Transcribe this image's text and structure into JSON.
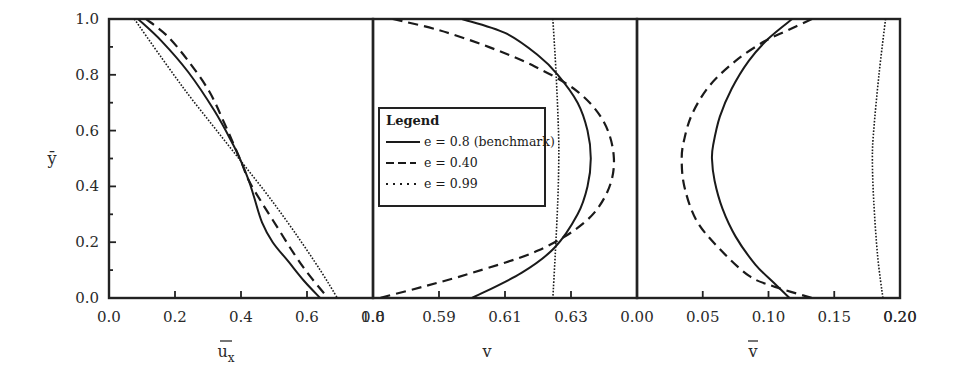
{
  "chart_data": [
    {
      "type": "line",
      "panel": "left",
      "xlabel": "ū_x",
      "ylabel": "ȳ",
      "xlim": [
        0.0,
        1.0
      ],
      "ylim": [
        0.0,
        1.0
      ],
      "xticks": [
        "0.0",
        "0.2",
        "0.4",
        "0.6",
        "0.8"
      ],
      "yticks": [
        "0.0",
        "0.2",
        "0.4",
        "0.6",
        "0.8",
        "1.0"
      ],
      "series": [
        {
          "name": "e = 0.8 (benchmark)",
          "style": "solid",
          "points": [
            [
              0.11,
              1.0
            ],
            [
              0.2,
              0.92
            ],
            [
              0.3,
              0.81
            ],
            [
              0.4,
              0.67
            ],
            [
              0.47,
              0.55
            ],
            [
              0.5,
              0.49
            ],
            [
              0.53,
              0.42
            ],
            [
              0.55,
              0.36
            ],
            [
              0.58,
              0.27
            ],
            [
              0.62,
              0.2
            ],
            [
              0.68,
              0.13
            ],
            [
              0.74,
              0.06
            ],
            [
              0.8,
              0.0
            ]
          ]
        },
        {
          "name": "e = 0.40",
          "style": "dashed",
          "points": [
            [
              0.14,
              1.0
            ],
            [
              0.22,
              0.94
            ],
            [
              0.3,
              0.85
            ],
            [
              0.38,
              0.74
            ],
            [
              0.44,
              0.62
            ],
            [
              0.5,
              0.49
            ],
            [
              0.53,
              0.42
            ],
            [
              0.58,
              0.34
            ],
            [
              0.64,
              0.25
            ],
            [
              0.7,
              0.16
            ],
            [
              0.76,
              0.08
            ],
            [
              0.83,
              0.0
            ]
          ]
        },
        {
          "name": "e = 0.99",
          "style": "dotted",
          "points": [
            [
              0.096,
              1.0
            ],
            [
              0.2,
              0.86
            ],
            [
              0.3,
              0.73
            ],
            [
              0.4,
              0.61
            ],
            [
              0.5,
              0.49
            ],
            [
              0.6,
              0.37
            ],
            [
              0.7,
              0.24
            ],
            [
              0.8,
              0.1
            ],
            [
              0.865,
              0.0
            ]
          ]
        }
      ]
    },
    {
      "type": "line",
      "panel": "middle",
      "xlabel": "v",
      "ylabel": "ȳ",
      "xlim": [
        0.57,
        0.65
      ],
      "ylim": [
        0.0,
        1.0
      ],
      "xticks": [
        "1.0",
        "0.59",
        "0.61",
        "0.63"
      ],
      "series": [
        {
          "name": "e = 0.8 (benchmark)",
          "style": "solid",
          "points": [
            [
              0.597,
              1.0
            ],
            [
              0.61,
              0.95
            ],
            [
              0.62,
              0.87
            ],
            [
              0.626,
              0.8
            ],
            [
              0.632,
              0.7
            ],
            [
              0.635,
              0.6
            ],
            [
              0.636,
              0.5
            ],
            [
              0.635,
              0.4
            ],
            [
              0.632,
              0.3
            ],
            [
              0.625,
              0.18
            ],
            [
              0.615,
              0.09
            ],
            [
              0.6,
              0.0
            ]
          ]
        },
        {
          "name": "e = 0.40",
          "style": "dashed",
          "points": [
            [
              0.576,
              1.0
            ],
            [
              0.59,
              0.96
            ],
            [
              0.605,
              0.9
            ],
            [
              0.619,
              0.83
            ],
            [
              0.632,
              0.74
            ],
            [
              0.64,
              0.63
            ],
            [
              0.643,
              0.5
            ],
            [
              0.641,
              0.38
            ],
            [
              0.634,
              0.27
            ],
            [
              0.62,
              0.17
            ],
            [
              0.6,
              0.09
            ],
            [
              0.585,
              0.04
            ],
            [
              0.572,
              0.0
            ]
          ]
        },
        {
          "name": "e = 0.99",
          "style": "dotted",
          "points": [
            [
              0.6245,
              1.0
            ],
            [
              0.6255,
              0.8
            ],
            [
              0.6262,
              0.6
            ],
            [
              0.6263,
              0.5
            ],
            [
              0.626,
              0.35
            ],
            [
              0.6252,
              0.15
            ],
            [
              0.6245,
              0.0
            ]
          ]
        }
      ]
    },
    {
      "type": "line",
      "panel": "right",
      "xlabel": "v̄",
      "ylabel": "ȳ",
      "xlim": [
        0.0,
        0.2
      ],
      "ylim": [
        0.0,
        1.0
      ],
      "xticks": [
        "0.00",
        "0.05",
        "0.10",
        "0.15",
        "0.20"
      ],
      "series": [
        {
          "name": "e = 0.8 (benchmark)",
          "style": "solid",
          "points": [
            [
              0.118,
              1.0
            ],
            [
              0.1,
              0.93
            ],
            [
              0.085,
              0.85
            ],
            [
              0.072,
              0.75
            ],
            [
              0.063,
              0.65
            ],
            [
              0.058,
              0.55
            ],
            [
              0.057,
              0.5
            ],
            [
              0.059,
              0.42
            ],
            [
              0.065,
              0.32
            ],
            [
              0.075,
              0.22
            ],
            [
              0.09,
              0.12
            ],
            [
              0.105,
              0.05
            ],
            [
              0.116,
              0.0
            ]
          ]
        },
        {
          "name": "e = 0.40",
          "style": "dashed",
          "points": [
            [
              0.133,
              1.0
            ],
            [
              0.115,
              0.96
            ],
            [
              0.097,
              0.92
            ],
            [
              0.075,
              0.85
            ],
            [
              0.055,
              0.76
            ],
            [
              0.042,
              0.66
            ],
            [
              0.036,
              0.57
            ],
            [
              0.034,
              0.5
            ],
            [
              0.036,
              0.4
            ],
            [
              0.045,
              0.28
            ],
            [
              0.062,
              0.18
            ],
            [
              0.085,
              0.08
            ],
            [
              0.105,
              0.04
            ],
            [
              0.133,
              0.0
            ]
          ]
        },
        {
          "name": "e = 0.99",
          "style": "dotted",
          "points": [
            [
              0.189,
              1.0
            ],
            [
              0.184,
              0.8
            ],
            [
              0.18,
              0.6
            ],
            [
              0.179,
              0.5
            ],
            [
              0.18,
              0.35
            ],
            [
              0.183,
              0.15
            ],
            [
              0.187,
              0.0
            ]
          ]
        }
      ]
    }
  ],
  "axes": {
    "y_label": "ȳ",
    "y_ticks": [
      "0.0",
      "0.2",
      "0.4",
      "0.6",
      "0.8",
      "1.0"
    ],
    "left_x_ticks": [
      "0.0",
      "0.2",
      "0.4",
      "0.6",
      "0.8"
    ],
    "middle_x_ticks": [
      "1.0",
      "0.59",
      "0.61",
      "0.63"
    ],
    "right_x_ticks": [
      "0.00",
      "0.05",
      "0.10",
      "0.15",
      "0.20"
    ],
    "left_x_label_main": "u",
    "left_x_label_sub": "x",
    "middle_x_label": "v",
    "right_x_label": "v"
  },
  "legend": {
    "title": "Legend",
    "items": [
      {
        "label": "e = 0.8 (benchmark)",
        "style": "solid"
      },
      {
        "label": "e = 0.40",
        "style": "dashed"
      },
      {
        "label": "e = 0.99",
        "style": "dotted"
      }
    ]
  },
  "colors": {
    "line": "#1a1a1a",
    "frame": "#222222",
    "background": "#ffffff"
  }
}
